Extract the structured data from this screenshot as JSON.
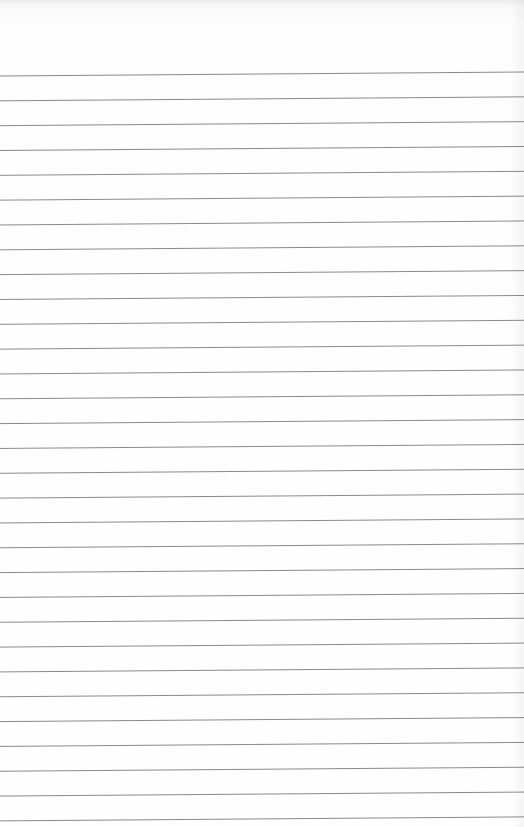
{
  "paper": {
    "type": "ruled-sheet",
    "line_color": "#8a8a8a",
    "background": "#fdfdfd",
    "line_count": 31,
    "first_line_y_left": 76,
    "first_line_y_right": 72,
    "line_spacing": 24.83
  }
}
